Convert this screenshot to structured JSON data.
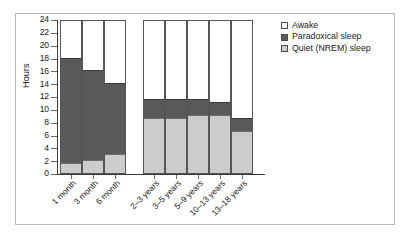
{
  "chart_data": {
    "type": "bar",
    "subtype": "stacked-bar",
    "title": "",
    "xlabel": "",
    "ylabel": "Hours",
    "ylim": [
      0,
      24
    ],
    "ytick_step": 2,
    "yticks": [
      0,
      2,
      4,
      6,
      8,
      10,
      12,
      14,
      16,
      18,
      20,
      22,
      24
    ],
    "grid": false,
    "legend_position": "right",
    "categories": [
      "1 month",
      "3 month",
      "6 month",
      "2–3 years",
      "3–5 years",
      "5–9 years",
      "10–13 years",
      "13–18 years"
    ],
    "groups": [
      {
        "name": "infants",
        "categories": [
          "1 month",
          "3 month",
          "6 month"
        ]
      },
      {
        "name": "children",
        "categories": [
          "2–3 years",
          "3–5 years",
          "5–9 years",
          "10–13 years",
          "13–18 years"
        ]
      }
    ],
    "series": [
      {
        "name": "Quiet (NREM) sleep",
        "color": "#cccccc",
        "values": [
          1.5,
          2.0,
          3.0,
          8.5,
          8.5,
          9.0,
          9.0,
          6.5
        ]
      },
      {
        "name": "Paradoxical sleep",
        "color": "#595959",
        "values": [
          16.5,
          14.0,
          11.0,
          3.0,
          3.0,
          2.5,
          2.0,
          2.0
        ]
      },
      {
        "name": "Awake",
        "color": "#ffffff",
        "values": [
          6.0,
          8.0,
          10.0,
          12.5,
          12.5,
          12.5,
          13.0,
          15.5
        ]
      }
    ],
    "totals_sleep": [
      18.0,
      16.0,
      14.0,
      11.5,
      11.5,
      11.5,
      11.0,
      8.5
    ]
  },
  "legend": {
    "items": [
      {
        "label": "Awake",
        "swatch": "awake"
      },
      {
        "label": "Paradoxical sleep",
        "swatch": "rem"
      },
      {
        "label": "Quiet (NREM) sleep",
        "swatch": "nrem"
      }
    ]
  },
  "axis": {
    "y_title": "Hours"
  }
}
